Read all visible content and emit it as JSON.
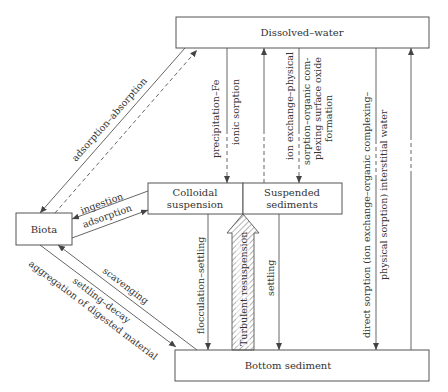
{
  "nodes": {
    "dissolved_water": "Dissolved–water",
    "colloidal_line1": "Colloidal",
    "colloidal_line2": "suspension",
    "suspended_line1": "Suspended",
    "suspended_line2": "sediments",
    "biota": "Biota",
    "bottom_sediment": "Bottom sediment"
  },
  "edges": {
    "adsorption_absorption": "adsorption–absorption",
    "precipitation_fe": "precipitation–Fe",
    "ionic_sorption": "ionic sorption",
    "ion_exchange_1": "ion exchange–physical",
    "ion_exchange_2": "sorption–organic com-",
    "ion_exchange_3": "plexing surface oxide",
    "ion_exchange_4": "formation",
    "direct_sorption_1": "direct sorption (ion exchange–organic complexing–",
    "direct_sorption_2": "physical sorption) interstitial water",
    "ingestion": "ingestion",
    "adsorption": "adsorption",
    "flocculation_settling": "flocculation–settling",
    "turbulent_resuspension": "Turbulent resuspension",
    "settling": "settling",
    "scavenging": "scavenging",
    "settling_decay": "settling–decay",
    "aggregation": "aggregation of digested material"
  },
  "colors": {
    "line": "#555555",
    "text": "#333333",
    "background": "#ffffff"
  }
}
